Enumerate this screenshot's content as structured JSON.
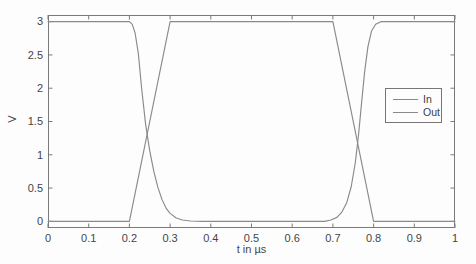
{
  "figure": {
    "background": "#fdfdfd",
    "axis_color": "#7a7a7a",
    "text_color": "#454545",
    "curve_colors": {
      "In": "#8a8a8a",
      "Out": "#8a8a8a"
    }
  },
  "chart_data": {
    "type": "line",
    "title": "",
    "xlabel": "t in µs",
    "ylabel": "V",
    "xlim": [
      0,
      1
    ],
    "ylim": [
      -0.1,
      3.1
    ],
    "grid": false,
    "x_ticks": [
      0,
      0.1,
      0.2,
      0.3,
      0.4,
      0.5,
      0.6,
      0.7,
      0.8,
      0.9,
      1
    ],
    "x_tick_labels": [
      "0",
      "0.1",
      "0.2",
      "0.3",
      "0.4",
      "0.5",
      "0.6",
      "0.7",
      "0.8",
      "0.9",
      "1"
    ],
    "y_ticks": [
      0,
      0.5,
      1,
      1.5,
      2,
      2.5,
      3
    ],
    "y_tick_labels": [
      "0",
      "0.5",
      "1",
      "1.5",
      "2",
      "2.5",
      "3"
    ],
    "legend": {
      "position": "middle-right",
      "entries": [
        {
          "label": "In"
        },
        {
          "label": "Out"
        }
      ]
    },
    "series": [
      {
        "name": "In",
        "description": "trapezoidal input pulse, 0 V to 3 V, linear rise 0.2-0.3 us, linear fall 0.7-0.8 us",
        "x": [
          0,
          0.2,
          0.3,
          0.7,
          0.8,
          1
        ],
        "y": [
          0,
          0,
          3,
          3,
          0,
          0
        ]
      },
      {
        "name": "Out",
        "description": "inverted output response, falls ~0.2-0.35 us, rises ~0.69-0.83 us, crossings near (0.245, 1.3) and (0.76, 1.25)",
        "x": [
          0,
          0.2,
          0.207,
          0.214,
          0.222,
          0.23,
          0.24,
          0.25,
          0.26,
          0.27,
          0.28,
          0.29,
          0.3,
          0.315,
          0.33,
          0.35,
          0.38,
          0.68,
          0.695,
          0.71,
          0.722,
          0.734,
          0.745,
          0.755,
          0.763,
          0.77,
          0.778,
          0.786,
          0.795,
          0.805,
          0.818,
          0.835,
          1
        ],
        "y": [
          3,
          3,
          2.96,
          2.83,
          2.52,
          2.0,
          1.45,
          1.06,
          0.75,
          0.51,
          0.33,
          0.2,
          0.12,
          0.05,
          0.02,
          0.005,
          0,
          0,
          0.02,
          0.06,
          0.14,
          0.28,
          0.52,
          0.88,
          1.3,
          1.75,
          2.25,
          2.62,
          2.86,
          2.96,
          3,
          3,
          3
        ]
      }
    ]
  }
}
